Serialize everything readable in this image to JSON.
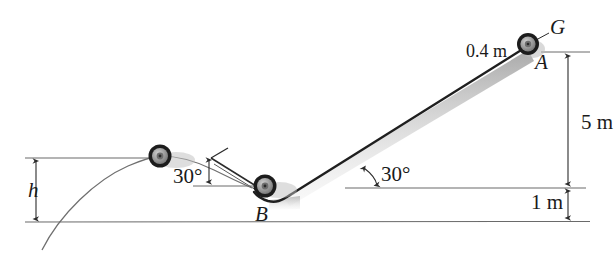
{
  "figure": {
    "type": "mechanics-diagram",
    "colors": {
      "line": "#2b2b2b",
      "thin_line": "#555555",
      "shadow": "#b8b8b8",
      "wheel_tire": "#1c1c1c",
      "wheel_hub": "#8a8a8a",
      "text": "#1a1a1a",
      "background": "#ffffff"
    }
  },
  "labels": {
    "wheel_G": "G",
    "point_A": "A",
    "point_B": "B",
    "wheel_radius": "0.4 m",
    "incline_angle_right": "30°",
    "ramp_angle_left": "30°",
    "height_5m": "5 m",
    "height_1m": "1 m",
    "height_h": "h"
  },
  "dimensions": {
    "wheel_radius_value": "0.4 m",
    "vertical_drop_A_to_ledge": "5 m",
    "ledge_to_ground": "1 m",
    "projectile_peak_height": "h",
    "incline_inclination": "30°",
    "ramp_inclination": "30°"
  },
  "geometry": {
    "wheel_A_center": [
      528,
      44
    ],
    "wheel_B_center": [
      265,
      186
    ],
    "wheel_apex_center": [
      160,
      156
    ],
    "wheel_radius_px": 11,
    "ground_line_y": 222,
    "ledge_line_y": 188,
    "apex_line_y": 158,
    "dim_axis_x": 568,
    "h_axis_x": 36
  }
}
